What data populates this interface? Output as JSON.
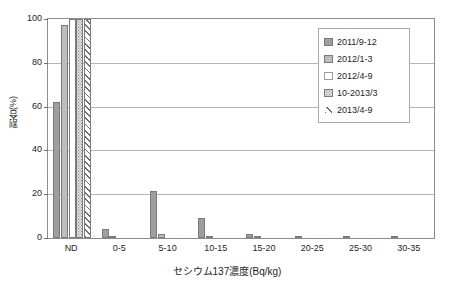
{
  "chart_data": {
    "type": "bar",
    "title": "",
    "subtitle": "",
    "xlabel": "セシウム137濃度(Bq/kg)",
    "ylabel": "割合(%)",
    "categories": [
      "ND",
      "0-5",
      "5-10",
      "10-15",
      "15-20",
      "20-25",
      "25-30",
      "30-35"
    ],
    "ylim": [
      0,
      100
    ],
    "yticks": [
      100,
      80,
      60,
      40,
      20,
      0
    ],
    "grid": true,
    "legend_position": "top-right-inside",
    "series": [
      {
        "name": "2011/9-12",
        "color": "#9e9e9e",
        "pattern": "solid-gray",
        "values": [
          62.2,
          3.9,
          21.5,
          9.2,
          1.9,
          0.5,
          0.1,
          0.3
        ]
      },
      {
        "name": "2012/1-3",
        "color": "#bdbdbd",
        "pattern": "solid-light-gray",
        "values": [
          97.2,
          0.6,
          1.9,
          0.2,
          0.1,
          0.0,
          0.0,
          0.0
        ]
      },
      {
        "name": "2012/4-9",
        "color": "#ffffff",
        "pattern": "white",
        "values": [
          100.0,
          0.0,
          0.0,
          0.0,
          0.0,
          0.0,
          0.0,
          0.0
        ]
      },
      {
        "name": "10-2013/3",
        "color": "#e2e2e2",
        "pattern": "dotted",
        "values": [
          100.0,
          0.0,
          0.0,
          0.0,
          0.0,
          0.0,
          0.0,
          0.0
        ]
      },
      {
        "name": "2013/4-9",
        "color": "#ffffff",
        "pattern": "diagonal-hatch",
        "values": [
          100.0,
          0.0,
          0.0,
          0.0,
          0.0,
          0.0,
          0.0,
          0.0
        ]
      }
    ]
  },
  "axes": {
    "y_tick_labels": [
      "100",
      "80",
      "60",
      "40",
      "20",
      "0"
    ],
    "x_tick_labels": [
      "ND",
      "0-5",
      "5-10",
      "10-15",
      "15-20",
      "20-25",
      "25-30",
      "30-35"
    ],
    "y_axis_title": "割合(%)",
    "x_axis_title": "セシウム137濃度(Bq/kg)"
  },
  "legend": {
    "items": [
      {
        "label": "2011/9-12"
      },
      {
        "label": "2012/1-3"
      },
      {
        "label": "2012/4-9"
      },
      {
        "label": "10-2013/3"
      },
      {
        "label": "2013/4-9"
      }
    ]
  }
}
